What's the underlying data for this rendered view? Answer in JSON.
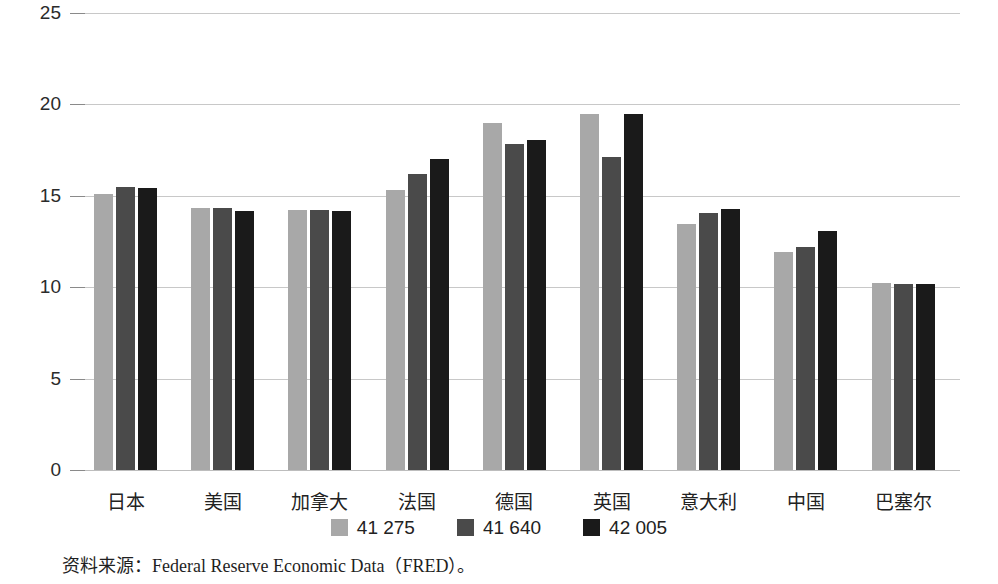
{
  "chart_data": {
    "type": "bar",
    "title": "",
    "subtitle": "",
    "xlabel": "",
    "ylabel": "",
    "ylim": [
      0,
      25
    ],
    "yticks": [
      0,
      5,
      10,
      15,
      20,
      25
    ],
    "ytick_labels": [
      "0",
      "5",
      "10",
      "15",
      "20",
      "25"
    ],
    "grid": true,
    "legend_position": "bottom",
    "categories": [
      "日本",
      "美国",
      "加拿大",
      "法国",
      "德国",
      "英国",
      "意大利",
      "中国",
      "巴塞尔"
    ],
    "series": [
      {
        "name": "41 275",
        "color": "#a8a8a8",
        "values": [
          15.1,
          14.35,
          14.25,
          15.3,
          19.0,
          19.45,
          13.45,
          11.9,
          10.25
        ]
      },
      {
        "name": "41 640",
        "color": "#4a4a4a",
        "values": [
          15.5,
          14.35,
          14.2,
          16.2,
          17.85,
          17.1,
          14.05,
          12.2,
          10.2
        ]
      },
      {
        "name": "42 005",
        "color": "#1a1a1a",
        "values": [
          15.45,
          14.15,
          14.15,
          17.0,
          18.05,
          19.5,
          14.3,
          13.1,
          10.2
        ]
      }
    ]
  },
  "legend": {
    "entries": [
      {
        "label": "41 275",
        "color": "#a8a8a8"
      },
      {
        "label": "41 640",
        "color": "#4a4a4a"
      },
      {
        "label": "42 005",
        "color": "#1a1a1a"
      }
    ]
  },
  "source": {
    "text": "资料来源：Federal Reserve Economic Data（FRED）。"
  },
  "colors": {
    "gridline": "#c8c8c8",
    "tick_text": "#2b2b2b",
    "category_text": "#222222"
  }
}
